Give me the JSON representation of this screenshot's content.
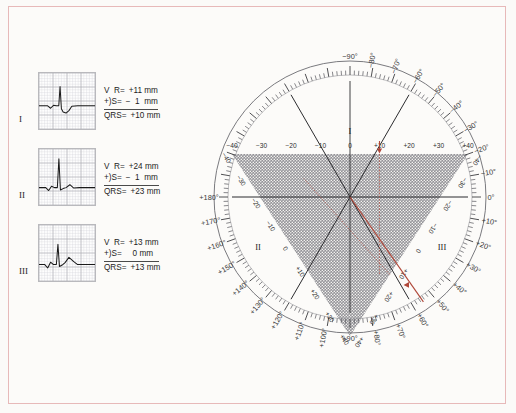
{
  "figure": {
    "border_color": "#e7b9b9",
    "vector_color": "#b0483a",
    "shade_color": "#6f6f73"
  },
  "leads": [
    {
      "roman": "I",
      "r_label": "V  R=",
      "r_value": "+11 mm",
      "s_label": "+)S=",
      "s_value": "−  1  mm",
      "qrs_label": "QRS=",
      "qrs_value": "+10 mm",
      "net": 10
    },
    {
      "roman": "II",
      "r_label": "V  R=",
      "r_value": "+24 mm",
      "s_label": "+)S=",
      "s_value": "−  1  mm",
      "qrs_label": "QRS=",
      "qrs_value": "+23 mm",
      "net": 23
    },
    {
      "roman": "III",
      "r_label": "V  R=",
      "r_value": "+13 mm",
      "s_label": "+)S=",
      "s_value": "   0 mm",
      "qrs_label": "QRS=",
      "qrs_value": "+13 mm",
      "net": 13
    }
  ],
  "chart_data": {
    "type": "scatter",
    "axis_scale_ticks": [
      -40,
      -30,
      -20,
      -10,
      0,
      10,
      20,
      30,
      40
    ],
    "lead_axes": [
      {
        "name": "I",
        "angle_deg": 0,
        "net_mm": 10,
        "marker": "down-arrow"
      },
      {
        "name": "II",
        "angle_deg": 60,
        "net_mm": 23,
        "marker": "none"
      },
      {
        "name": "III",
        "angle_deg": 120,
        "net_mm": 13,
        "marker": "left-triangle"
      }
    ],
    "mean_axis_deg": 55,
    "degree_labels": [
      "−90°",
      "−80°",
      "−70°",
      "−60°",
      "−50°",
      "−40°",
      "−30°",
      "−20°",
      "−10°",
      "0°",
      "+10°",
      "+20°",
      "+30°",
      "+40°",
      "+50°",
      "+60°",
      "+70°",
      "+80°",
      "+90°",
      "+100°",
      "+110°",
      "+120°",
      "+130°",
      "+140°",
      "+150°",
      "+160°",
      "+170°",
      "+180°"
    ],
    "lead_I_tick_labels": [
      "−40",
      "−30",
      "−20",
      "−10",
      "0",
      "+10",
      "+20",
      "+30",
      "+40"
    ],
    "lead_II_tick_labels": [
      "−40",
      "−30",
      "−20",
      "−10",
      "0",
      "+10",
      "+20",
      "+30",
      "+40"
    ],
    "lead_III_tick_labels": [
      "−40",
      "−30",
      "−20",
      "−10",
      "0",
      "+10",
      "+20",
      "+30",
      "+40"
    ],
    "roman_in_circle": [
      "I",
      "II",
      "III"
    ],
    "grid": false,
    "legend": "none"
  }
}
